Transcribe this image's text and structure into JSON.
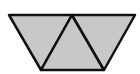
{
  "diagram": {
    "fill_color": "#c8c8c8",
    "stroke_color": "#111111",
    "vertices": {
      "top_left": [
        9,
        15
      ],
      "top_mid": [
        72,
        15
      ],
      "top_right": [
        135,
        15
      ],
      "bottom_left": [
        41,
        70
      ],
      "bottom_right": [
        104,
        70
      ]
    },
    "triangles": [
      {
        "name": "left-inverted",
        "points": "9,15 72,15 41,70"
      },
      {
        "name": "middle-upright",
        "points": "72,15 41,70 104,70"
      },
      {
        "name": "right-inverted",
        "points": "72,15 135,15 104,70"
      }
    ]
  }
}
